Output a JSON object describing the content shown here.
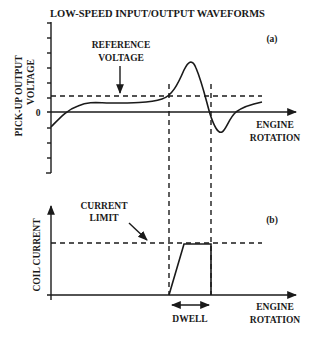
{
  "title": "LOW-SPEED INPUT/OUTPUT WAVEFORMS",
  "panel_a": {
    "tag": "(a)",
    "ylabel_line1": "PICK-UP OUTPUT",
    "ylabel_line2": "VOLTAGE",
    "zero_label": "0",
    "xlabel_line1": "ENGINE",
    "xlabel_line2": "ROTATION",
    "reference_label_line1": "REFERENCE",
    "reference_label_line2": "VOLTAGE"
  },
  "panel_b": {
    "tag": "(b)",
    "ylabel": "COIL CURRENT",
    "xlabel_line1": "ENGINE",
    "xlabel_line2": "ROTATION",
    "limit_label_line1": "CURRENT",
    "limit_label_line2": "LIMIT",
    "dwell_label": "DWELL"
  },
  "colors": {
    "ink": "#1a1a1a",
    "background": "#ffffff"
  }
}
